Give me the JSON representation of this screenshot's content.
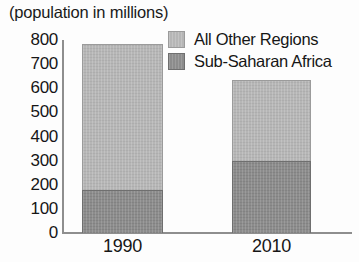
{
  "chart_data": {
    "type": "bar",
    "subtype": "stacked-bar",
    "title": "(population in millions)",
    "xlabel": "",
    "ylabel": "",
    "categories": [
      "1990",
      "2010"
    ],
    "series": [
      {
        "name": "Sub-Saharan Africa",
        "values": [
          180,
          300
        ],
        "color": "#8c8c8c"
      },
      {
        "name": "All Other Regions",
        "values": [
          605,
          335
        ],
        "color": "#b6b6b6"
      }
    ],
    "totals": [
      785,
      635
    ],
    "ylim": [
      0,
      800
    ],
    "yticks": [
      "800",
      "700",
      "600",
      "500",
      "400",
      "300",
      "200",
      "100",
      "0"
    ],
    "ytick_values": [
      800,
      700,
      600,
      500,
      400,
      300,
      200,
      100,
      0
    ],
    "grid": false,
    "legend_position": "top-right",
    "legend": [
      "All Other Regions",
      "Sub-Saharan Africa"
    ]
  },
  "axis": {
    "y_line_color": "#8e8e8e",
    "x_line_color": "#8e8e8e"
  },
  "legend_rows": [
    {
      "label": "All Other Regions",
      "swatch": "light"
    },
    {
      "label": "Sub-Saharan Africa",
      "swatch": "dark"
    }
  ]
}
